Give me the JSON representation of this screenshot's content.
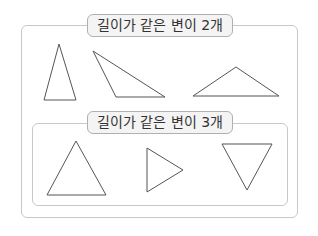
{
  "groups": [
    {
      "label": "길이가 같은 변이 2개",
      "shapes": [
        {
          "name": "tall-isosceles-triangle",
          "points": "59,44 44,100 76,100"
        },
        {
          "name": "obtuse-triangle",
          "points": "93,51 116,97 165,97"
        },
        {
          "name": "wide-isosceles-triangle",
          "points": "236,67 193,96 279,96"
        }
      ]
    },
    {
      "label": "길이가 같은 변이 3개",
      "shapes": [
        {
          "name": "equilateral-triangle-up",
          "points": "76,141 47,195 106,195"
        },
        {
          "name": "equilateral-triangle-right",
          "points": "147,148 147,192 183,170"
        },
        {
          "name": "equilateral-triangle-down",
          "points": "222,144 272,144 247,190"
        }
      ]
    }
  ],
  "colors": {
    "border": "#c8c8c8",
    "label_bg": "#f4f4f4",
    "stroke": "#555555"
  }
}
